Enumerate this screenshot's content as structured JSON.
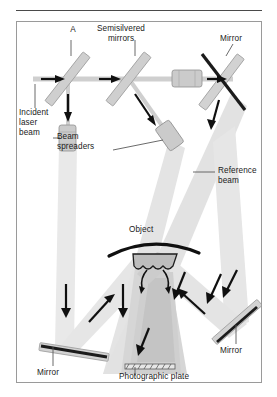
{
  "figure": {
    "panel_letter": "A"
  },
  "labels": {
    "panel": "A",
    "semisilvered_mirrors": "Semisilvered\nmirrors",
    "incident_laser_beam": "Incident\nlaser\nbeam",
    "beam_spreaders": "Beam\nspreaders",
    "mirror_top_right": "Mirror",
    "reference_beam": "Reference\nbeam",
    "object": "Object",
    "mirror_bottom_left": "Mirror",
    "mirror_bottom_right": "Mirror",
    "photographic_plate": "Photographic plate"
  },
  "colors": {
    "panel_border": "#9a9a9a",
    "rule": "#4a4a4a",
    "beam_light": "#e9e9e9",
    "beam_mid": "#d8d8d8",
    "beam_dark": "#c4c4c4",
    "optic_body": "#c9c9c9",
    "optic_edge": "#8d8d8d",
    "mirror_face": "#1b1b1b",
    "arrow": "#101010",
    "text": "#1a1a1a",
    "background": "#ffffff"
  },
  "components": {
    "semisilvered_mirror_1": "semisilvered-mirror",
    "semisilvered_mirror_2": "semisilvered-mirror",
    "beam_spreader_vertical": "cylindrical-lens",
    "beam_spreader_horizontal": "cylindrical-lens",
    "beam_spreader_diagonal": "cylindrical-lens",
    "mirror_top_right": "mirror",
    "mirror_bottom_left": "mirror",
    "mirror_bottom_right": "mirror",
    "object": "curved-object",
    "photographic_plate": "photographic-plate"
  }
}
